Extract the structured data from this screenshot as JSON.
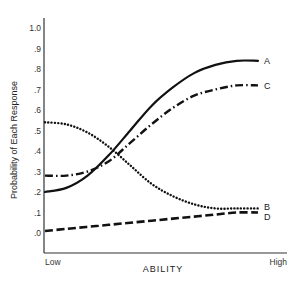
{
  "chart_data": {
    "type": "line",
    "title": "",
    "xlabel": "ABILITY",
    "ylabel": "Probability of Each Response",
    "x_tick_labels": [
      "Low",
      "High"
    ],
    "y_ticks": [
      ".0",
      ".1",
      ".2",
      ".3",
      ".4",
      ".5",
      ".6",
      ".7",
      ".8",
      ".9",
      "1.0"
    ],
    "ylim": [
      0,
      1.0
    ],
    "grid": false,
    "legend_position": "inline-right",
    "x": [
      0,
      0.1,
      0.2,
      0.3,
      0.4,
      0.5,
      0.6,
      0.7,
      0.8,
      0.9,
      1.0
    ],
    "series": [
      {
        "name": "A",
        "style": "solid",
        "values": [
          0.2,
          0.22,
          0.28,
          0.38,
          0.5,
          0.62,
          0.71,
          0.78,
          0.82,
          0.84,
          0.84
        ]
      },
      {
        "name": "B",
        "style": "dotted",
        "values": [
          0.54,
          0.53,
          0.49,
          0.42,
          0.33,
          0.24,
          0.18,
          0.14,
          0.12,
          0.12,
          0.12
        ]
      },
      {
        "name": "C",
        "style": "dash-dot",
        "values": [
          0.28,
          0.28,
          0.3,
          0.35,
          0.44,
          0.53,
          0.61,
          0.67,
          0.7,
          0.72,
          0.72
        ]
      },
      {
        "name": "D",
        "style": "dashed",
        "values": [
          0.01,
          0.02,
          0.03,
          0.04,
          0.05,
          0.06,
          0.07,
          0.08,
          0.09,
          0.1,
          0.1
        ]
      }
    ]
  }
}
